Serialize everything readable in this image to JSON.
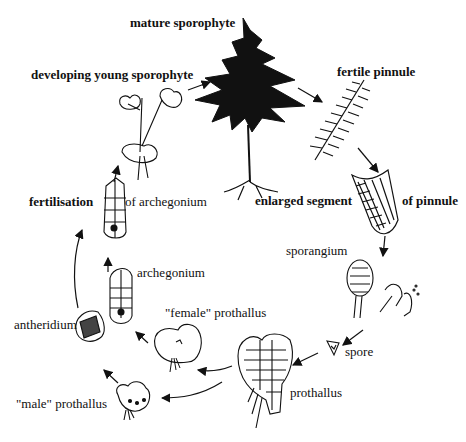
{
  "diagram": {
    "stages": [
      {
        "id": "mature_sporophyte",
        "label": "mature sporophyte"
      },
      {
        "id": "fertile_pinnule",
        "label": "fertile pinnule"
      },
      {
        "id": "enlarged_segment_left",
        "label": "enlarged segment"
      },
      {
        "id": "enlarged_segment_right",
        "label": "of pinnule"
      },
      {
        "id": "sporangium",
        "label": "sporangium"
      },
      {
        "id": "spore",
        "label": "spore"
      },
      {
        "id": "prothallus",
        "label": "prothallus"
      },
      {
        "id": "female_prothallus",
        "label": "\"female\" prothallus"
      },
      {
        "id": "male_prothallus",
        "label": "\"male\" prothallus"
      },
      {
        "id": "antheridium",
        "label": "antheridium"
      },
      {
        "id": "archegonium",
        "label": "archegonium"
      },
      {
        "id": "fertilisation_left",
        "label": "fertilisation"
      },
      {
        "id": "fertilisation_right",
        "label": "of archegonium"
      },
      {
        "id": "developing_young_sporophyte",
        "label": "developing young sporophyte"
      }
    ],
    "flow": [
      "developing young sporophyte -> mature sporophyte",
      "mature sporophyte -> fertile pinnule",
      "fertile pinnule -> enlarged segment of pinnule",
      "enlarged segment of pinnule -> sporangium",
      "sporangium -> spore",
      "spore -> prothallus",
      "prothallus -> \"female\" prothallus",
      "prothallus -> \"male\" prothallus",
      "\"male\" prothallus -> antheridium",
      "\"female\" prothallus -> archegonium",
      "antheridium -> fertilisation of archegonium",
      "archegonium -> fertilisation of archegonium",
      "fertilisation of archegonium -> developing young sporophyte"
    ]
  }
}
